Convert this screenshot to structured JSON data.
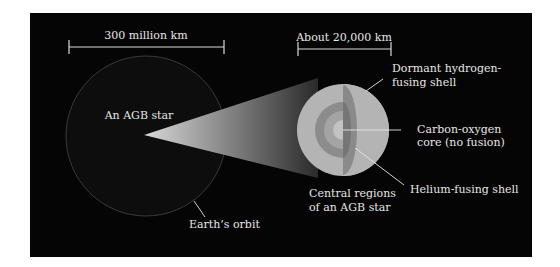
{
  "colors": {
    "background": "#ffffff",
    "panel": "#050505",
    "label": "#e6e6e6",
    "scale_bar": "#d9d9d9",
    "orbit": "#3a3a3a",
    "big_star_fill": "#0d0d0d",
    "envelope": "#b4b4b4",
    "dormant_h_shell": "#8a8a8a",
    "helium_shell": "#767676",
    "core": "#a8a8a8",
    "inner_core": "#c4c4c4"
  },
  "scale_bars": [
    {
      "label": "300 million km"
    },
    {
      "label": "About 20,000 km"
    }
  ],
  "labels": {
    "agb_star": "An AGB star",
    "earths_orbit": "Earth’s orbit",
    "dormant_shell_line1": "Dormant hydrogen-",
    "dormant_shell_line2": "fusing shell",
    "core_line1": "Carbon-oxygen",
    "core_line2": "core (no fusion)",
    "helium_shell": "Helium-fusing shell",
    "central_line1": "Central regions",
    "central_line2": "of an AGB star"
  }
}
